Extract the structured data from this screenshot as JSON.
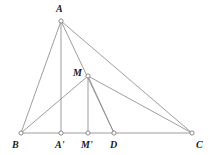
{
  "figure": {
    "kind": "geometry-diagram",
    "background_color": "#ffffff",
    "line_color": "#8d8d8d",
    "label_color": "#1a1a1a",
    "vertex_fill": "#ffffff",
    "vertex_stroke": "#7a7a7a",
    "viewbox": {
      "width": 212,
      "height": 155
    },
    "points": [
      {
        "id": "A",
        "label": "A",
        "x": 61,
        "y": 21,
        "label_x": 56,
        "label_y": 4
      },
      {
        "id": "M",
        "label": "M",
        "x": 88,
        "y": 76,
        "label_x": 73,
        "label_y": 68
      },
      {
        "id": "B",
        "label": "B",
        "x": 21,
        "y": 133,
        "label_x": 12,
        "label_y": 140
      },
      {
        "id": "Ap",
        "label": "A'",
        "x": 61,
        "y": 133,
        "label_x": 55,
        "label_y": 140
      },
      {
        "id": "Mp",
        "label": "M'",
        "x": 88,
        "y": 133,
        "label_x": 81,
        "label_y": 140
      },
      {
        "id": "D",
        "label": "D",
        "x": 114,
        "y": 133,
        "label_x": 110,
        "label_y": 140
      },
      {
        "id": "C",
        "label": "C",
        "x": 192,
        "y": 133,
        "label_x": 196,
        "label_y": 140
      }
    ],
    "segments": [
      {
        "id": "AB",
        "name": "segment-a-b",
        "x1": 61,
        "y1": 21,
        "x2": 21,
        "y2": 133
      },
      {
        "id": "AAp",
        "name": "altitude-a-aprime",
        "x1": 61,
        "y1": 21,
        "x2": 61,
        "y2": 133
      },
      {
        "id": "AD",
        "name": "cevian-a-d",
        "x1": 61,
        "y1": 21,
        "x2": 114,
        "y2": 133
      },
      {
        "id": "AC",
        "name": "segment-a-c",
        "x1": 61,
        "y1": 21,
        "x2": 192,
        "y2": 133
      },
      {
        "id": "BC",
        "name": "base-b-c",
        "x1": 21,
        "y1": 133,
        "x2": 192,
        "y2": 133
      },
      {
        "id": "BM",
        "name": "segment-b-m",
        "x1": 21,
        "y1": 133,
        "x2": 88,
        "y2": 76
      },
      {
        "id": "MMp",
        "name": "altitude-m-mprime",
        "x1": 88,
        "y1": 76,
        "x2": 88,
        "y2": 133
      },
      {
        "id": "MD",
        "name": "segment-m-d",
        "x1": 88,
        "y1": 76,
        "x2": 114,
        "y2": 133
      },
      {
        "id": "MC",
        "name": "segment-m-c",
        "x1": 88,
        "y1": 76,
        "x2": 192,
        "y2": 133
      }
    ],
    "vertex_radius": 2.1
  }
}
